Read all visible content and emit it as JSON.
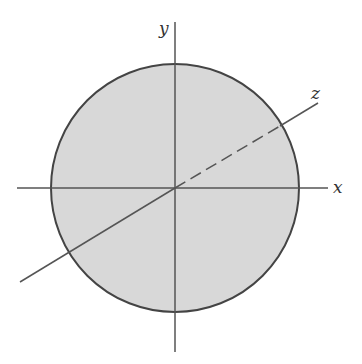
{
  "diagram": {
    "colors": {
      "fill": "#d9d9d9",
      "stroke": "#444444",
      "axis": "#555555"
    },
    "labels": {
      "x": "x",
      "y": "y",
      "z": "z"
    }
  }
}
